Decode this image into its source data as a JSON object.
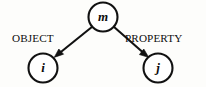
{
  "figure": {
    "kind": "directed-graph-diagram",
    "background_color": "#fdfdfb",
    "ink_color": "#111111",
    "width": 206,
    "height": 87
  },
  "nodes": [
    {
      "id": "m",
      "label": "m",
      "role": "root",
      "cx": 103,
      "cy": 17,
      "r": 14.5
    },
    {
      "id": "i",
      "label": "i",
      "role": "object",
      "cx": 43,
      "cy": 68,
      "r": 14.5
    },
    {
      "id": "j",
      "label": "j",
      "role": "property",
      "cx": 158,
      "cy": 68,
      "r": 14.5
    }
  ],
  "edges": [
    {
      "id": "edge-object",
      "from": "m",
      "to": "i",
      "label": "OBJECT",
      "label_x": 12,
      "label_y": 42,
      "direction": "down-left"
    },
    {
      "id": "edge-property",
      "from": "m",
      "to": "j",
      "label": "PROPERTY",
      "label_x": 125,
      "label_y": 42,
      "direction": "down-right"
    }
  ]
}
